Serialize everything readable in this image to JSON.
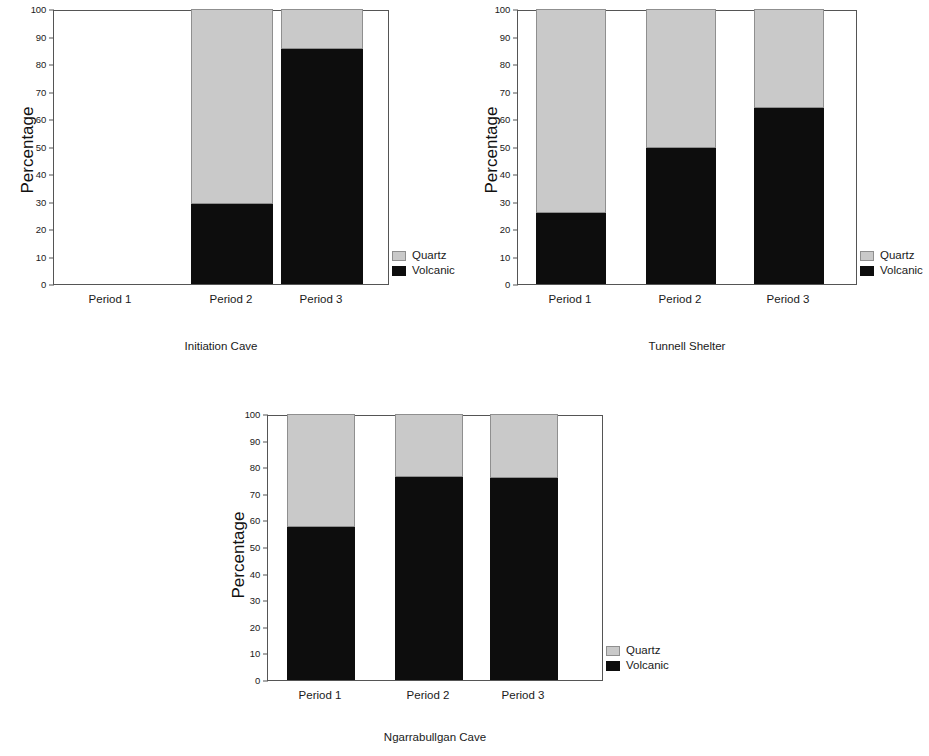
{
  "figure": {
    "shared_ylabel": "Percentage",
    "shared_categories": [
      "Period 1",
      "Period 2",
      "Period 3"
    ],
    "legend": {
      "quartz_label": "Quartz",
      "volcanic_label": "Volcanic"
    },
    "colors": {
      "quartz": "#c9c9c9",
      "volcanic": "#0d0d0d",
      "axis": "#555555",
      "background": "#ffffff"
    },
    "y_ticks": [
      0,
      10,
      20,
      30,
      40,
      50,
      60,
      70,
      80,
      90,
      100
    ],
    "y_tick_labels": [
      "0",
      "10",
      "20",
      "30",
      "40",
      "50",
      "60",
      "70",
      "80",
      "90",
      "100"
    ]
  },
  "chart_data": [
    {
      "type": "bar",
      "stacked": true,
      "title": "Initiation Cave",
      "xlabel": "",
      "ylabel": "Percentage",
      "ylim": [
        0,
        100
      ],
      "grid": false,
      "legend_position": "right",
      "categories": [
        "Period 1",
        "Period 2",
        "Period 3"
      ],
      "series": [
        {
          "name": "Volcanic",
          "values": [
            null,
            29.0,
            85.5
          ],
          "color": "#0d0d0d"
        },
        {
          "name": "Quartz",
          "values": [
            null,
            71.0,
            14.5
          ],
          "color": "#c9c9c9"
        }
      ],
      "notes": "Period 1 has no data (no bar drawn)"
    },
    {
      "type": "bar",
      "stacked": true,
      "title": "Tunnell Shelter",
      "xlabel": "",
      "ylabel": "Percentage",
      "ylim": [
        0,
        100
      ],
      "grid": false,
      "legend_position": "right",
      "categories": [
        "Period 1",
        "Period 2",
        "Period 3"
      ],
      "series": [
        {
          "name": "Volcanic",
          "values": [
            26.0,
            49.5,
            64.0
          ],
          "color": "#0d0d0d"
        },
        {
          "name": "Quartz",
          "values": [
            74.0,
            50.5,
            36.0
          ],
          "color": "#c9c9c9"
        }
      ]
    },
    {
      "type": "bar",
      "stacked": true,
      "title": "Ngarrabullgan Cave",
      "xlabel": "",
      "ylabel": "Percentage",
      "ylim": [
        0,
        100
      ],
      "grid": false,
      "legend_position": "right",
      "categories": [
        "Period 1",
        "Period 2",
        "Period 3"
      ],
      "series": [
        {
          "name": "Volcanic",
          "values": [
            57.5,
            76.5,
            76.0
          ],
          "color": "#0d0d0d"
        },
        {
          "name": "Quartz",
          "values": [
            42.5,
            23.5,
            24.0
          ],
          "color": "#c9c9c9"
        }
      ]
    }
  ]
}
